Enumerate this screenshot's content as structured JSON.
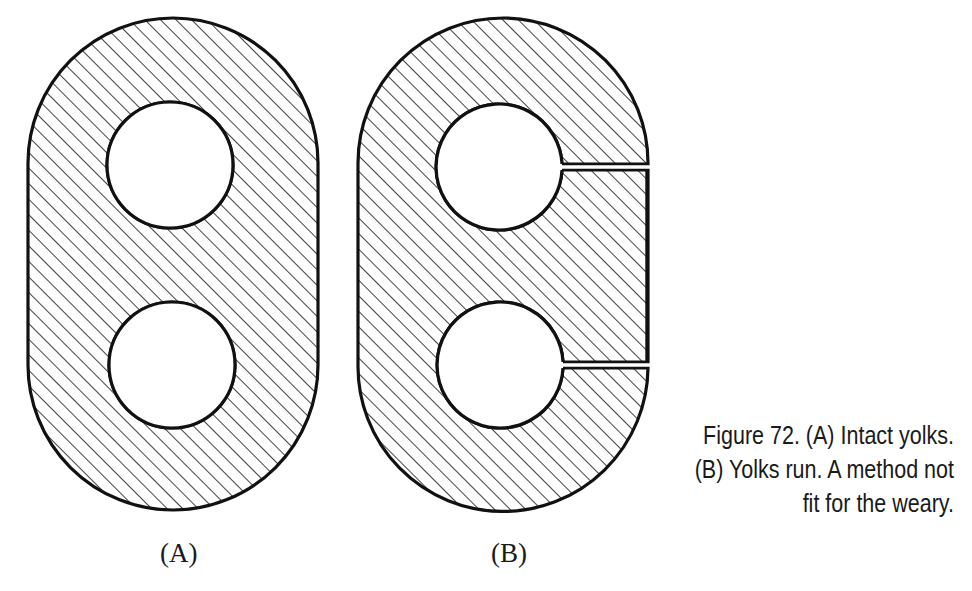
{
  "figure": {
    "number": "Figure 72.",
    "panels": [
      {
        "id": "A",
        "label": "(A)",
        "description": "Intact yolks"
      },
      {
        "id": "B",
        "label": "(B)",
        "description": "Yolks run"
      }
    ],
    "caption_lines": [
      "Figure 72. (A) Intact yolks.",
      "(B) Yolks run. A method not",
      "fit for the weary."
    ],
    "colors": {
      "stroke": "#111111",
      "hatch": "#111111",
      "background": "#ffffff"
    }
  }
}
